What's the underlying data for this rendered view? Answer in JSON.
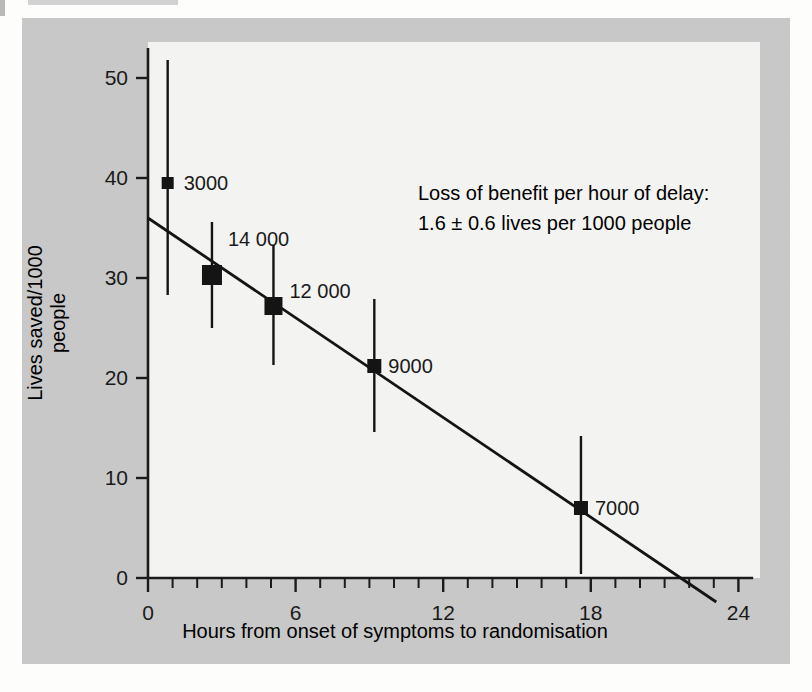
{
  "figure": {
    "background_color": "#c8c8c8",
    "plot_background_color": "#f3f3f1",
    "ink_color": "#141414"
  },
  "annotation": {
    "line1": "Loss of benefit per hour of delay:",
    "line2": "1.6 ± 0.6 lives per 1000 people"
  },
  "chart_data": {
    "type": "scatter",
    "title": "",
    "subtitle": "",
    "xlabel": "Hours from onset of symptoms to randomisation",
    "ylabel": "Lives saved/1000 people",
    "xlim": [
      0,
      24.6
    ],
    "ylim": [
      0,
      53
    ],
    "grid": false,
    "legend": "none",
    "legend_position": "none",
    "x_ticks": [
      0,
      6,
      12,
      18,
      24
    ],
    "x_tick_labels": [
      "0",
      "6",
      "12",
      "18",
      "24"
    ],
    "x_minor_tick_step": 1,
    "y_ticks": [
      0,
      10,
      20,
      30,
      40,
      50
    ],
    "y_tick_labels": [
      "0",
      "10",
      "20",
      "30",
      "40",
      "50"
    ],
    "points": [
      {
        "label": "3000",
        "x": 0.8,
        "y": 39.5,
        "ci_low": 28.3,
        "ci_high": 51.8,
        "marker_size": 12,
        "label_dx": 16,
        "label_dy": 7
      },
      {
        "label": "14 000",
        "x": 2.6,
        "y": 30.3,
        "ci_low": 25.0,
        "ci_high": 35.6,
        "marker_size": 20,
        "label_dx": 16,
        "label_dy": -29
      },
      {
        "label": "12 000",
        "x": 5.1,
        "y": 27.2,
        "ci_low": 21.3,
        "ci_high": 33.3,
        "marker_size": 18,
        "label_dx": 16,
        "label_dy": -8
      },
      {
        "label": "9000",
        "x": 9.2,
        "y": 21.2,
        "ci_low": 14.6,
        "ci_high": 27.9,
        "marker_size": 14,
        "label_dx": 14,
        "label_dy": 7
      },
      {
        "label": "7000",
        "x": 17.6,
        "y": 7.0,
        "ci_low": 0.4,
        "ci_high": 14.2,
        "marker_size": 14,
        "label_dx": 14,
        "label_dy": 7
      }
    ],
    "fit_line": {
      "name": "regression line",
      "x_start": 0.0,
      "y_start": 36.0,
      "x_end": 23.1,
      "y_end": -2.4,
      "slope": -1.6,
      "intercept": 36.0
    },
    "series": [
      {
        "name": "Lives saved per 1000 people by delay",
        "x": [
          0.8,
          2.6,
          5.1,
          9.2,
          17.6
        ],
        "values": [
          39.5,
          30.3,
          27.2,
          21.2,
          7.0
        ],
        "ci_low": [
          28.3,
          25.0,
          21.3,
          14.6,
          0.4
        ],
        "ci_high": [
          51.8,
          35.6,
          33.3,
          27.9,
          14.2
        ],
        "point_labels": [
          "3000",
          "14 000",
          "12 000",
          "9000",
          "7000"
        ]
      }
    ]
  }
}
